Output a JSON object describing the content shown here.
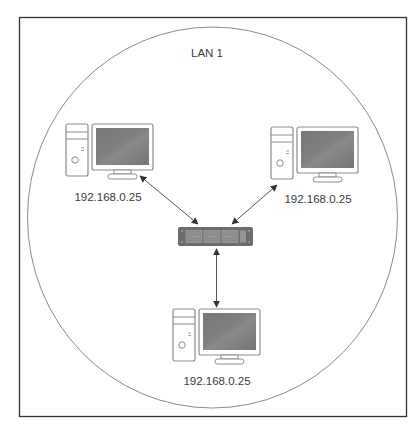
{
  "diagram": {
    "title": "LAN 1",
    "network_boundary": {
      "shape": "circle",
      "label": "LAN 1"
    },
    "hub": {
      "type": "switch",
      "name": "network-switch"
    },
    "nodes": [
      {
        "id": "left-computer",
        "type": "computer",
        "ip": "192.168.0.25",
        "position": "top-left"
      },
      {
        "id": "right-computer",
        "type": "computer",
        "ip": "192.168.0.25",
        "position": "top-right"
      },
      {
        "id": "bottom-computer",
        "type": "computer",
        "ip": "192.168.0.25",
        "position": "bottom"
      }
    ],
    "links": [
      {
        "from": "left-computer",
        "to": "network-switch",
        "style": "bidirectional-arrow"
      },
      {
        "from": "right-computer",
        "to": "network-switch",
        "style": "bidirectional-arrow"
      },
      {
        "from": "bottom-computer",
        "to": "network-switch",
        "style": "bidirectional-arrow"
      }
    ],
    "colors": {
      "frame": "#333333",
      "circle": "#8a8a8a",
      "device_outline": "#8c8c8c",
      "screen": "#7c7c7c",
      "switch_body": "#6c6c6c",
      "arrow": "#555555",
      "text": "#3a3a3a"
    }
  }
}
